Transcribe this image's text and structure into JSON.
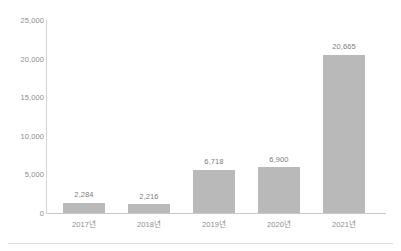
{
  "chart_data": {
    "type": "bar",
    "title": "",
    "subtitle": "",
    "xlabel": "",
    "ylabel": "",
    "categories": [
      "2017년",
      "2018년",
      "2019년",
      "2020년",
      "2021년"
    ],
    "values": [
      2284,
      2216,
      6718,
      6900,
      20665
    ],
    "value_labels": [
      "2,284",
      "2,216",
      "6,718",
      "6,900",
      "20,665"
    ],
    "bar_plot_heights": [
      1340,
      1120,
      5620,
      5960,
      20500
    ],
    "ylim": [
      0,
      25000
    ],
    "ytick_values": [
      0,
      5000,
      10000,
      15000,
      20000,
      25000
    ],
    "ytick_labels": [
      "0",
      "5,000",
      "10,000",
      "15,000",
      "20,000",
      "25,000"
    ],
    "grid": false,
    "legend": null,
    "legend_position": "none",
    "colors": {
      "bar_fill": "#b9b9b9",
      "axis_line": "#c9c9c9",
      "y_axis_line": "#d4d4d4",
      "tick_label": "#8d8d8d",
      "value_label": "#7d7d7d",
      "background": "#ffffff",
      "bottom_rule": "#dedede"
    }
  }
}
